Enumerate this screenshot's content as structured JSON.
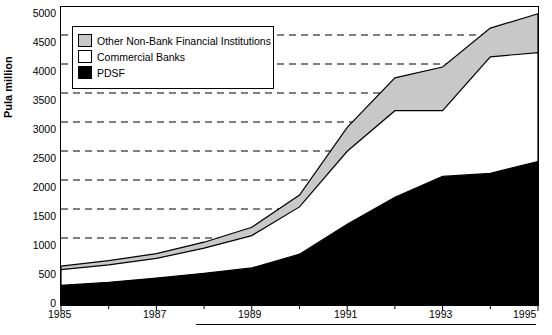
{
  "chart_data": {
    "type": "area",
    "title": "",
    "subtitle": "",
    "xlabel": "",
    "ylabel": "Pula million",
    "stacked": true,
    "grid": true,
    "grid_style": "dashed-horizontal",
    "legend_position": "top-left-inside",
    "xlim": [
      1985,
      1995
    ],
    "ylim": [
      0,
      5000
    ],
    "yticks": [
      0,
      500,
      1000,
      1500,
      2000,
      2500,
      3000,
      3500,
      4000,
      4500,
      5000
    ],
    "xticks": [
      1985,
      1987,
      1989,
      1991,
      1993,
      1995
    ],
    "xticks_minor": [
      1986,
      1988,
      1990,
      1992,
      1994
    ],
    "x": [
      1985,
      1986,
      1987,
      1988,
      1989,
      1990,
      1991,
      1992,
      1993,
      1994,
      1995
    ],
    "series": [
      {
        "name": "PDSF",
        "color": "#000000",
        "values": [
          330,
          380,
          450,
          530,
          620,
          850,
          1350,
          1800,
          2150,
          2200,
          2400
        ]
      },
      {
        "name": "Commercial Banks",
        "color": "#ffffff",
        "values": [
          260,
          290,
          330,
          420,
          540,
          790,
          1220,
          1450,
          1100,
          1950,
          1820
        ]
      },
      {
        "name": "Other Non-Bank Financial Institutions",
        "color": "#c8c8c8",
        "values": [
          60,
          70,
          80,
          100,
          140,
          200,
          400,
          550,
          730,
          480,
          650
        ]
      }
    ],
    "cumulative_totals": [
      650,
      740,
      860,
      1050,
      1300,
      1840,
      2970,
      3800,
      3980,
      4630,
      4870
    ],
    "cumulative_pdsf_plus_banks": [
      590,
      670,
      780,
      950,
      1160,
      1640,
      2570,
      3250,
      3250,
      4150,
      4220
    ],
    "annotations": []
  },
  "legend": {
    "items": [
      {
        "label": "Other Non-Bank Financial Institutions",
        "swatch": "gray"
      },
      {
        "label": "Commercial Banks",
        "swatch": "white"
      },
      {
        "label": "PDSF",
        "swatch": "black"
      }
    ]
  },
  "axes": {
    "y_label": "Pula million",
    "y_ticks": [
      "5000",
      "4500",
      "4000",
      "3500",
      "3000",
      "2500",
      "2000",
      "1500",
      "1000",
      "500",
      "0"
    ],
    "x_ticks": [
      "1985",
      "1987",
      "1989",
      "1991",
      "1993",
      "1995"
    ]
  }
}
